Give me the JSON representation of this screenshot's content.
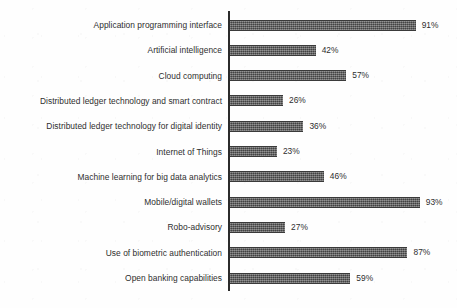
{
  "chart_data": {
    "type": "bar",
    "orientation": "horizontal",
    "title": "",
    "subtitle": "",
    "xlabel": "",
    "ylabel": "",
    "xlim": [
      0,
      100
    ],
    "grid": false,
    "legend": null,
    "value_label_suffix": "%",
    "categories": [
      "Application programming interface",
      "Artificial intelligence",
      "Cloud computing",
      "Distributed ledger technology and smart contract",
      "Distributed ledger technology for digital identity",
      "Internet of Things",
      "Machine learning for big data analytics",
      "Mobile/digital wallets",
      "Robo-advisory",
      "Use of biometric authentication",
      "Open banking capabilities"
    ],
    "values": [
      91,
      42,
      57,
      26,
      36,
      23,
      46,
      93,
      27,
      87,
      59
    ],
    "value_labels": [
      "91%",
      "42%",
      "57%",
      "26%",
      "36%",
      "23%",
      "46%",
      "93%",
      "27%",
      "87%",
      "59%"
    ],
    "bars": [
      {
        "category": "Application programming interface",
        "value": 91,
        "label": "91%"
      },
      {
        "category": "Artificial intelligence",
        "value": 42,
        "label": "42%"
      },
      {
        "category": "Cloud computing",
        "value": 57,
        "label": "57%"
      },
      {
        "category": "Distributed ledger technology and smart contract",
        "value": 26,
        "label": "26%"
      },
      {
        "category": "Distributed ledger technology for digital identity",
        "value": 36,
        "label": "36%"
      },
      {
        "category": "Internet of Things",
        "value": 23,
        "label": "23%"
      },
      {
        "category": "Machine learning for big data analytics",
        "value": 46,
        "label": "46%"
      },
      {
        "category": "Mobile/digital wallets",
        "value": 93,
        "label": "93%"
      },
      {
        "category": "Robo-advisory",
        "value": 27,
        "label": "27%"
      },
      {
        "category": "Use of biometric authentication",
        "value": 87,
        "label": "87%"
      },
      {
        "category": "Open banking capabilities",
        "value": 59,
        "label": "59%"
      }
    ],
    "colors": {
      "bar_fill": "#5b5b5b",
      "axis_line": "#2b2b2b",
      "text": "#2e2e2e",
      "background": "#fefefe"
    }
  },
  "layout": {
    "axis_x_px": 228,
    "axis_top_px": 11,
    "axis_height_px": 280,
    "bar_origin_x_px": 230,
    "px_per_percent": 2.04,
    "row_pitch_px": 25.3,
    "first_row_center_y_px": 25,
    "bar_height_px": 9
  }
}
